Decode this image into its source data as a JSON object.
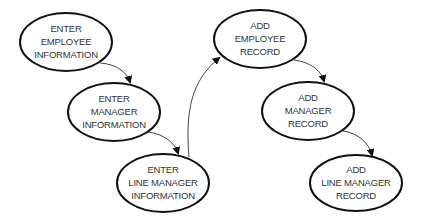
{
  "diagram": {
    "type": "flow",
    "nodes": [
      {
        "id": "n1",
        "lines": [
          "ENTER",
          "EMPLOYEE",
          "INFORMATION"
        ],
        "cx": 66,
        "cy": 42,
        "rx": 46,
        "ry": 29
      },
      {
        "id": "n2",
        "lines": [
          "ENTER",
          "MANAGER",
          "INFORMATION"
        ],
        "cx": 114,
        "cy": 112,
        "rx": 46,
        "ry": 29
      },
      {
        "id": "n3",
        "lines": [
          "ENTER",
          "LINE MANAGER",
          "INFORMATION"
        ],
        "cx": 163,
        "cy": 183,
        "rx": 46,
        "ry": 29
      },
      {
        "id": "n4",
        "lines": [
          "ADD",
          "EMPLOYEE",
          "RECORD"
        ],
        "cx": 260,
        "cy": 39,
        "rx": 46,
        "ry": 29
      },
      {
        "id": "n5",
        "lines": [
          "ADD",
          "MANAGER",
          "RECORD"
        ],
        "cx": 308,
        "cy": 111,
        "rx": 46,
        "ry": 29
      },
      {
        "id": "n6",
        "lines": [
          "ADD",
          "LINE MANAGER",
          "RECORD"
        ],
        "cx": 356,
        "cy": 183,
        "rx": 46,
        "ry": 28
      }
    ],
    "edges": [
      {
        "from": "n1",
        "to": "n2"
      },
      {
        "from": "n2",
        "to": "n3"
      },
      {
        "from": "n3",
        "to": "n4"
      },
      {
        "from": "n4",
        "to": "n5"
      },
      {
        "from": "n5",
        "to": "n6"
      }
    ]
  }
}
